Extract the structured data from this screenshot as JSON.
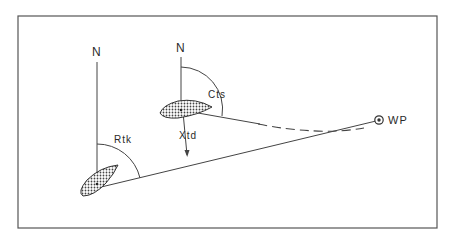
{
  "diagram": {
    "labels": {
      "north_1": "N",
      "north_2": "N",
      "rtk": "Rtk",
      "cts": "Cts",
      "xtd": "Xtd",
      "wp": "WP"
    },
    "colors": {
      "line": "#444444",
      "frame": "#555555",
      "hatch": "#555555",
      "background": "#ffffff"
    }
  }
}
